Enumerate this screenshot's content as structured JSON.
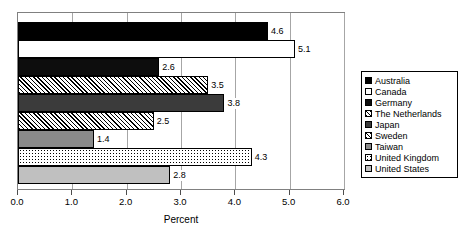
{
  "chart_data": {
    "type": "bar",
    "orientation": "horizontal",
    "title": "",
    "xlabel": "Percent",
    "ylabel": "",
    "xlim": [
      0.0,
      6.0
    ],
    "xticks": [
      "0.0",
      "1.0",
      "2.0",
      "3.0",
      "4.0",
      "5.0",
      "6.0"
    ],
    "grid": true,
    "legend_position": "right",
    "categories": [
      "Australia",
      "Canada",
      "Germany",
      "The Netherlands",
      "Japan",
      "Sweden",
      "Taiwan",
      "United Kingdom",
      "United States"
    ],
    "values": [
      4.6,
      5.1,
      2.6,
      3.5,
      3.8,
      2.5,
      1.4,
      4.3,
      2.8
    ],
    "data_labels": [
      "4.6",
      "5.1",
      "2.6",
      "3.5",
      "3.8",
      "2.5",
      "1.4",
      "4.3",
      "2.8"
    ],
    "series": [
      {
        "name": "Percent",
        "points": [
          {
            "category": "Australia",
            "value": 4.6,
            "label": "4.6",
            "fill": "solid-black",
            "swatch": "solid-black"
          },
          {
            "category": "Canada",
            "value": 5.1,
            "label": "5.1",
            "fill": "white",
            "swatch": "white"
          },
          {
            "category": "Germany",
            "value": 2.6,
            "label": "2.6",
            "fill": "near-black",
            "swatch": "near-black"
          },
          {
            "category": "The Netherlands",
            "value": 3.5,
            "label": "3.5",
            "fill": "hatch-diag",
            "swatch": "hatch-diag"
          },
          {
            "category": "Japan",
            "value": 3.8,
            "label": "3.8",
            "fill": "dark-gray",
            "swatch": "dark-gray"
          },
          {
            "category": "Sweden",
            "value": 2.5,
            "label": "2.5",
            "fill": "hatch-diag2",
            "swatch": "hatch-diag2"
          },
          {
            "category": "Taiwan",
            "value": 1.4,
            "label": "1.4",
            "fill": "mid-gray",
            "swatch": "mid-gray"
          },
          {
            "category": "United Kingdom",
            "value": 4.3,
            "label": "4.3",
            "fill": "dots",
            "swatch": "dots"
          },
          {
            "category": "United States",
            "value": 2.8,
            "label": "2.8",
            "fill": "light-gray",
            "swatch": "light-gray"
          }
        ]
      }
    ]
  },
  "legend": {
    "items": [
      {
        "label": "Australia"
      },
      {
        "label": "Canada"
      },
      {
        "label": "Germany"
      },
      {
        "label": "The Netherlands"
      },
      {
        "label": "Japan"
      },
      {
        "label": "Sweden"
      },
      {
        "label": "Taiwan"
      },
      {
        "label": "United Kingdom"
      },
      {
        "label": "United States"
      }
    ]
  },
  "colors": {
    "frame": "#808080",
    "gridline": "#a6a6a6",
    "text": "#000000",
    "background": "#ffffff"
  }
}
